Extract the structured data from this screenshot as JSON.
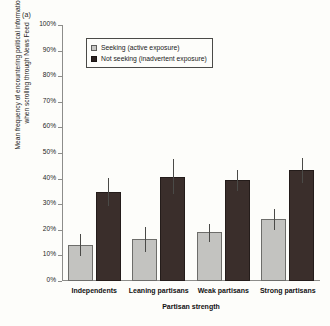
{
  "panel_label": "(a)",
  "chart_data": {
    "type": "bar",
    "title": "",
    "xlabel": "Partisan strength",
    "ylabel": "Mean frequency of encountering political information when scrolling through News Feed",
    "ylabel_lines": [
      "Mean frequency of encountering political information",
      "when scrolling through News Feed"
    ],
    "categories": [
      "Independents",
      "Leaning partisans",
      "Weak partisans",
      "Strong partisans"
    ],
    "series": [
      {
        "name": "Seeking (active exposure)",
        "color": "#c3c3c0",
        "values": [
          14,
          16.3,
          19.2,
          24.3
        ],
        "err_low": [
          9.7,
          11.5,
          15.3,
          19.8
        ],
        "err_high": [
          18.3,
          21,
          22.3,
          28
        ]
      },
      {
        "name": "Not seeking (inadvertent exposure)",
        "color": "#3a2e2b",
        "values": [
          34.8,
          40.8,
          39.4,
          43.2
        ],
        "err_low": [
          29.4,
          33.8,
          35.2,
          38.3
        ],
        "err_high": [
          40.3,
          47.8,
          43.5,
          48
        ]
      }
    ],
    "ylim": [
      0,
      100
    ],
    "yticks": [
      0,
      10,
      20,
      30,
      40,
      50,
      60,
      70,
      80,
      90,
      100
    ],
    "ytick_labels": [
      "0%",
      "10%",
      "20%",
      "30%",
      "40%",
      "50%",
      "60%",
      "70%",
      "80%",
      "90%",
      "100%"
    ],
    "grid": false,
    "legend_position": "top-left-inside",
    "legend": [
      "Seeking (active exposure)",
      "Not seeking (inadvertent exposure)"
    ]
  }
}
